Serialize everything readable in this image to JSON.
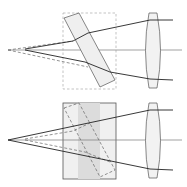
{
  "diagram": {
    "colors": {
      "background": "#ffffff",
      "ray": "#222222",
      "axis": "#7a7a7a",
      "dashed": "#8a8a8a",
      "glass_fill": "#efefef",
      "glass_dark": "#dcdcdc",
      "outline": "#555555"
    },
    "panels": [
      {
        "id": "top",
        "label": "tilted-plate",
        "axis_y": 50,
        "source_solid": [
          25,
          49
        ],
        "source_dashed": [
          8,
          50
        ],
        "plate_polygon": "64,18 79,13 115,80 100,87",
        "dashed_box": {
          "x": 63,
          "y": 13,
          "w": 53,
          "h": 76
        },
        "lens": {
          "cx": 153,
          "top": 13,
          "bottom": 88,
          "half_width": 7
        },
        "ray_upper": "25,49 73,41 88,33 150,20 173,20",
        "ray_lower": "25,50 85,62 110,72 150,79 173,80",
        "dashed_upper": "8,50 73,41",
        "dashed_lower": "8,50 88,67"
      },
      {
        "id": "bottom",
        "label": "equivalent-block",
        "axis_y": 140,
        "source_solid": [
          8,
          140
        ],
        "source_dashed": [
          25,
          139
        ],
        "block": {
          "x": 63,
          "y": 103,
          "w": 53,
          "h": 76
        },
        "band": {
          "x": 78,
          "w": 22
        },
        "dashed_plate_polygon": "64,108 79,103 115,170 100,177",
        "lens": {
          "cx": 153,
          "top": 103,
          "bottom": 178,
          "half_width": 7
        },
        "ray_upper": "8,140 150,110 173,110",
        "ray_lower": "8,140 150,169 173,170",
        "dashed_upper": "25,139 73,131 90,123",
        "dashed_lower": "25,140 85,152 110,162"
      }
    ]
  }
}
